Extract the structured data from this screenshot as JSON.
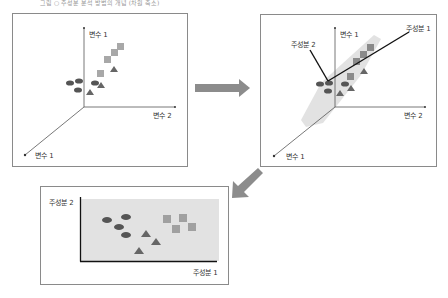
{
  "caption": "그림 ○ 주성분 분석 방법의 개념 (차원 축소)",
  "panel1": {
    "axis_y_label": "변수 1",
    "axis_x_label": "변수 2",
    "axis_z_label": "변수 1"
  },
  "panel2": {
    "axis_y_label": "변수 1",
    "axis_x_label": "변수 2",
    "axis_z_label": "변수 1",
    "pc1_label": "주성분 1",
    "pc2_label": "주성분 2"
  },
  "panel3": {
    "y_label": "주성분 2",
    "x_label": "주성분 1"
  },
  "colors": {
    "circle": "#555555",
    "triangle": "#666666",
    "square": "#a8a8a8",
    "plane": "#e2e2e2",
    "arrow": "#8c8c8c",
    "border": "#8a8a8a"
  }
}
